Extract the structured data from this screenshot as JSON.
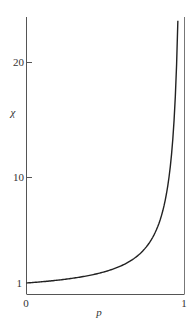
{
  "chart_data": {
    "type": "line",
    "title": "",
    "xlabel": "p",
    "ylabel": "χ",
    "xlim": [
      0,
      1
    ],
    "ylim": [
      1,
      24
    ],
    "x_ticks": [
      "0",
      "1"
    ],
    "y_ticks": [
      "1",
      "10",
      "20"
    ],
    "grid": false,
    "legend": null,
    "series": [
      {
        "name": "χ(p)",
        "x": [
          0,
          0.1,
          0.2,
          0.3,
          0.4,
          0.5,
          0.6,
          0.7,
          0.75,
          0.8,
          0.85,
          0.9,
          0.93,
          0.95,
          0.958
        ],
        "values": [
          1,
          1.11,
          1.25,
          1.43,
          1.67,
          2.0,
          2.5,
          3.33,
          4.0,
          5.0,
          6.67,
          10.0,
          14.3,
          20.0,
          24.0
        ]
      }
    ],
    "annotations": [
      "vertical asymptote line at p = 1"
    ]
  },
  "labels": {
    "x_axis": "p",
    "y_axis": "χ",
    "x_tick_0": "0",
    "x_tick_1": "1",
    "y_tick_1": "1",
    "y_tick_10": "10",
    "y_tick_20": "20"
  }
}
